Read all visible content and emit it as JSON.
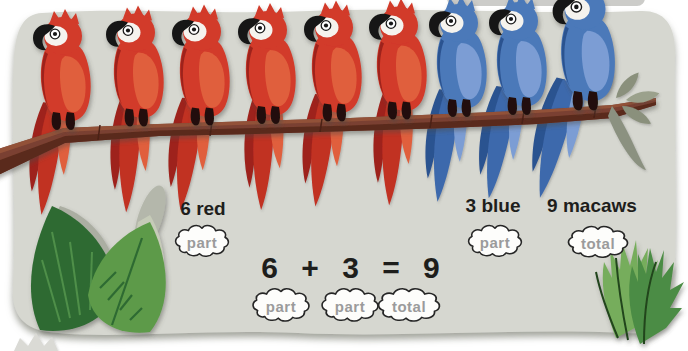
{
  "labels": {
    "red": "6 red",
    "blue": "3 blue",
    "total": "9 macaws"
  },
  "equation": "6 + 3 = 9",
  "clouds": {
    "top": [
      "part",
      "part",
      "total"
    ],
    "bottom": [
      "part",
      "part",
      "total"
    ]
  },
  "macaws": [
    "red",
    "red",
    "red",
    "red",
    "red",
    "red",
    "blue",
    "blue",
    "blue"
  ],
  "counts": {
    "red": 6,
    "blue": 3,
    "total": 9
  },
  "colors": {
    "red_macaw": "#d23a2a",
    "blue_macaw": "#4b79b9",
    "branch": "#7a4130",
    "leaf_dark": "#2e6b33",
    "leaf_light": "#5d9a48",
    "panel_bg": "#d6d7d0",
    "cloud_text": "#9b9b9b"
  }
}
